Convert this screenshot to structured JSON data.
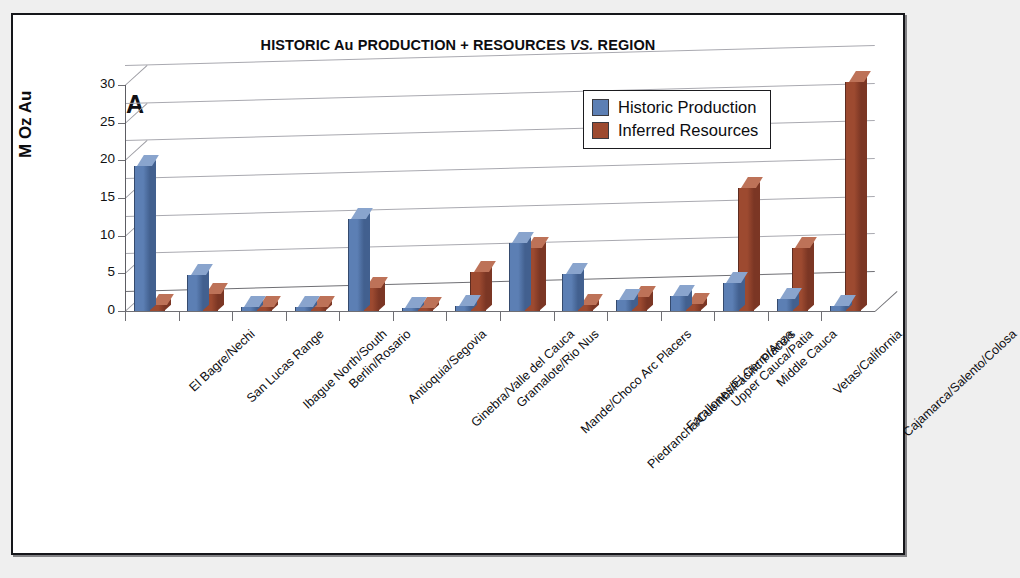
{
  "figure": {
    "panel_letter": "A",
    "title_part1": "HISTORIC Au PRODUCTION + RESOURCES ",
    "title_italic": "VS.",
    "title_part2": " REGION",
    "title_full": "HISTORIC Au PRODUCTION + RESOURCES VS. REGION"
  },
  "colors": {
    "series_historic_production": "#5c7fb4",
    "series_historic_production_top": "#89a4cd",
    "series_historic_production_side": "#42608f",
    "series_inferred_resources": "#9d4a30",
    "series_inferred_resources_top": "#bd7258",
    "series_inferred_resources_side": "#7b3624",
    "gridline": "#a9a9b0",
    "axis": "#6f6f74",
    "frame": "#15161a",
    "text": "#0d0d10",
    "plot_background": "#ffffff"
  },
  "legend": {
    "position": "inside-top-right",
    "entries": [
      {
        "label": "Historic Production",
        "color": "#5c7fb4"
      },
      {
        "label": "Inferred Resources",
        "color": "#9d4a30"
      }
    ]
  },
  "chart_data": {
    "type": "bar",
    "title": "HISTORIC Au PRODUCTION + RESOURCES VS. REGION",
    "xlabel": "",
    "ylabel": "M Oz Au",
    "ylim": [
      0,
      30
    ],
    "yticks": [
      0,
      5,
      10,
      15,
      20,
      25,
      30
    ],
    "ytick_labels": [
      "0",
      "5",
      "10",
      "15",
      "20",
      "25",
      "30"
    ],
    "grid": true,
    "legend_position": "inside-top-right",
    "style": "3d-clustered-column",
    "categories": [
      "El Bagre/Nechi",
      "San Lucas Range",
      "Ibague North/South",
      "Berlin/Rosario",
      "Antioquia/Segovia",
      "Ginebra/Valle del Cauca",
      "Gramalote/Rio Nus",
      "Mande/Choco Arc Placers",
      "Piedrancha/Cuembi/Pacific Placers",
      "Farallones/El Cerro/Anza",
      "Upper Cauca/Patia",
      "Middle Cauca",
      "Vetas/California",
      "Cajamarca/Salento/Colosa"
    ],
    "series": [
      {
        "name": "Historic Production",
        "color": "#5c7fb4",
        "values": [
          19.3,
          4.8,
          0.5,
          0.5,
          12.2,
          0.4,
          0.6,
          9.0,
          4.9,
          1.5,
          2.0,
          3.7,
          1.6,
          0.6
        ]
      },
      {
        "name": "Inferred Resources",
        "color": "#9d4a30",
        "values": [
          0.8,
          2.3,
          0.5,
          0.5,
          3.0,
          0.4,
          5.2,
          8.3,
          0.8,
          1.8,
          0.9,
          16.3,
          8.3,
          30.4
        ]
      }
    ]
  }
}
